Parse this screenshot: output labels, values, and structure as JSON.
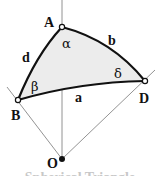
{
  "diagram": {
    "title": "Spherical Triangle",
    "fill_color": "#ececec",
    "edge_color": "#111111",
    "ray_color": "#777777",
    "vertices": {
      "A": {
        "label": "A",
        "x": 62,
        "y": 27
      },
      "B": {
        "label": "B",
        "x": 18,
        "y": 100
      },
      "D": {
        "label": "D",
        "x": 145,
        "y": 81
      },
      "O": {
        "label": "O",
        "x": 62,
        "y": 159
      }
    },
    "sides": {
      "a": "a",
      "b": "b",
      "d": "d"
    },
    "angles": {
      "alpha": "α",
      "beta": "β",
      "delta": "δ"
    }
  }
}
